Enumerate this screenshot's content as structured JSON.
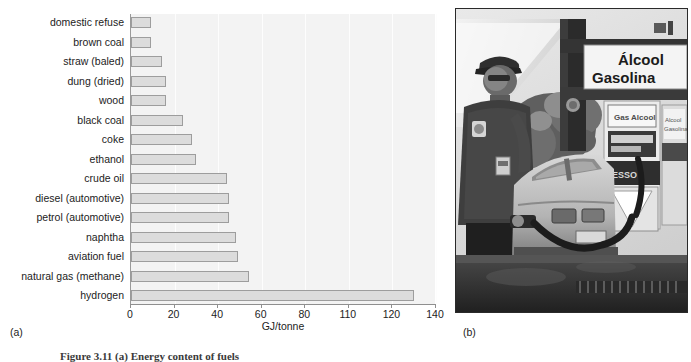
{
  "figure": {
    "panel_a_label": "(a)",
    "panel_b_label": "(b)",
    "caption": "Figure 3.11  (a) Energy content of fuels"
  },
  "chart_data": {
    "type": "bar",
    "orientation": "horizontal",
    "title": "",
    "xlabel": "GJ/tonne",
    "ylabel": "",
    "xlim": [
      0,
      140
    ],
    "grid": true,
    "legend": "none",
    "tick_labels": [
      "0",
      "20",
      "40",
      "60",
      "80",
      "110",
      "120",
      "140"
    ],
    "tick_values": [
      0,
      20,
      40,
      60,
      80,
      100,
      120,
      140
    ],
    "categories": [
      "domestic refuse",
      "brown coal",
      "straw (baled)",
      "dung (dried)",
      "wood",
      "black coal",
      "coke",
      "ethanol",
      "crude oil",
      "diesel (automotive)",
      "petrol (automotive)",
      "naphtha",
      "aviation fuel",
      "natural gas (methane)",
      "hydrogen"
    ],
    "values": [
      9,
      9,
      14,
      16,
      16,
      24,
      28,
      30,
      44,
      45,
      45,
      48,
      49,
      54,
      130
    ],
    "bar_fill_color": "#dcdcdc",
    "bar_border_color": "#9d9d9d",
    "plot_background": "#f3f3f3"
  },
  "photo": {
    "alt": "Black and white photograph of a Brazilian service station attendant standing beside a car being refuelled",
    "sign_line_1": "Álcool",
    "sign_line_2": "Gasolina",
    "pump_brand": "ESSO",
    "pump_label_1": "Gas Alcool",
    "pump_label_2": "Alcool Gasolina"
  }
}
